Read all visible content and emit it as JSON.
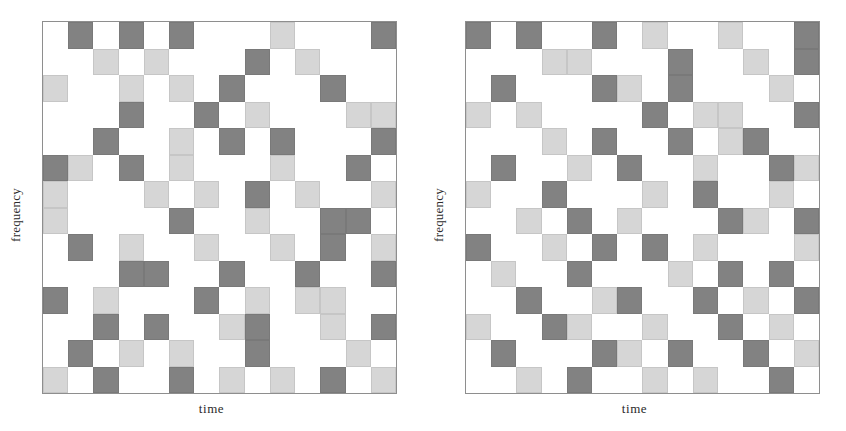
{
  "figure": {
    "title": "",
    "panels": [
      {
        "name": "left-panel",
        "xlabel": "time",
        "ylabel": "frequency"
      },
      {
        "name": "right-panel",
        "xlabel": "time",
        "ylabel": "frequency"
      }
    ]
  },
  "colors": {
    "dark_cell": "#828282",
    "light_cell": "#d6d6d6",
    "background": "#ffffff",
    "frame": "#8e8e8e",
    "text": "#2b2b2b"
  },
  "chart_data": {
    "type": "heatmap",
    "title": "",
    "xlabel": "time",
    "ylabel": "frequency",
    "grid": false,
    "legend": "none",
    "rows": 14,
    "cols": 14,
    "value_legend": {
      "0": "empty",
      "1": "dark",
      "2": "light"
    },
    "panels": [
      {
        "name": "left-panel",
        "xlabel": "time",
        "ylabel": "frequency",
        "matrix": [
          [
            0,
            1,
            0,
            1,
            0,
            1,
            0,
            0,
            0,
            2,
            0,
            0,
            0,
            1
          ],
          [
            0,
            0,
            2,
            0,
            2,
            0,
            0,
            0,
            1,
            0,
            2,
            0,
            0,
            0
          ],
          [
            2,
            0,
            0,
            2,
            0,
            2,
            0,
            1,
            0,
            0,
            0,
            1,
            0,
            0
          ],
          [
            0,
            0,
            0,
            1,
            0,
            0,
            1,
            0,
            2,
            0,
            0,
            0,
            2,
            2
          ],
          [
            0,
            0,
            1,
            0,
            0,
            2,
            0,
            1,
            0,
            1,
            0,
            0,
            0,
            1
          ],
          [
            1,
            2,
            0,
            1,
            0,
            2,
            0,
            0,
            0,
            2,
            0,
            0,
            1,
            0
          ],
          [
            2,
            0,
            0,
            0,
            2,
            0,
            2,
            0,
            1,
            0,
            2,
            0,
            0,
            2
          ],
          [
            2,
            0,
            0,
            0,
            0,
            1,
            0,
            0,
            2,
            0,
            0,
            1,
            1,
            0
          ],
          [
            0,
            1,
            0,
            2,
            0,
            0,
            2,
            0,
            0,
            2,
            0,
            1,
            0,
            2
          ],
          [
            0,
            0,
            0,
            1,
            1,
            0,
            0,
            1,
            0,
            0,
            1,
            0,
            0,
            1
          ],
          [
            1,
            0,
            2,
            0,
            0,
            0,
            1,
            0,
            2,
            0,
            2,
            2,
            0,
            0
          ],
          [
            0,
            0,
            1,
            0,
            1,
            0,
            0,
            2,
            1,
            0,
            0,
            2,
            0,
            1
          ],
          [
            0,
            1,
            0,
            2,
            0,
            2,
            0,
            0,
            1,
            0,
            0,
            0,
            2,
            0
          ],
          [
            2,
            0,
            1,
            0,
            0,
            1,
            0,
            2,
            0,
            2,
            0,
            1,
            0,
            2
          ]
        ]
      },
      {
        "name": "right-panel",
        "xlabel": "time",
        "ylabel": "frequency",
        "matrix": [
          [
            1,
            0,
            1,
            0,
            0,
            1,
            0,
            2,
            0,
            0,
            2,
            0,
            0,
            1
          ],
          [
            0,
            0,
            0,
            2,
            2,
            0,
            0,
            0,
            1,
            0,
            0,
            2,
            0,
            1
          ],
          [
            0,
            1,
            0,
            0,
            0,
            1,
            2,
            0,
            1,
            0,
            0,
            0,
            2,
            0
          ],
          [
            2,
            0,
            2,
            0,
            0,
            0,
            0,
            1,
            0,
            2,
            2,
            0,
            0,
            1
          ],
          [
            0,
            0,
            0,
            2,
            0,
            1,
            0,
            0,
            1,
            0,
            2,
            1,
            0,
            0
          ],
          [
            0,
            1,
            0,
            0,
            2,
            0,
            1,
            0,
            0,
            2,
            0,
            0,
            1,
            2
          ],
          [
            2,
            0,
            0,
            1,
            0,
            0,
            0,
            2,
            0,
            1,
            0,
            0,
            2,
            0
          ],
          [
            0,
            0,
            2,
            0,
            1,
            0,
            2,
            0,
            0,
            0,
            1,
            2,
            0,
            1
          ],
          [
            1,
            0,
            0,
            2,
            0,
            1,
            0,
            1,
            0,
            2,
            0,
            0,
            0,
            2
          ],
          [
            0,
            2,
            0,
            0,
            1,
            0,
            0,
            0,
            2,
            0,
            1,
            0,
            1,
            0
          ],
          [
            0,
            0,
            1,
            0,
            0,
            2,
            1,
            0,
            0,
            1,
            0,
            2,
            0,
            1
          ],
          [
            2,
            0,
            0,
            1,
            2,
            0,
            0,
            2,
            0,
            0,
            1,
            0,
            2,
            0
          ],
          [
            0,
            1,
            0,
            0,
            0,
            1,
            2,
            0,
            1,
            0,
            0,
            1,
            0,
            2
          ],
          [
            0,
            0,
            2,
            0,
            1,
            0,
            0,
            2,
            0,
            2,
            0,
            0,
            1,
            0
          ]
        ]
      }
    ]
  }
}
